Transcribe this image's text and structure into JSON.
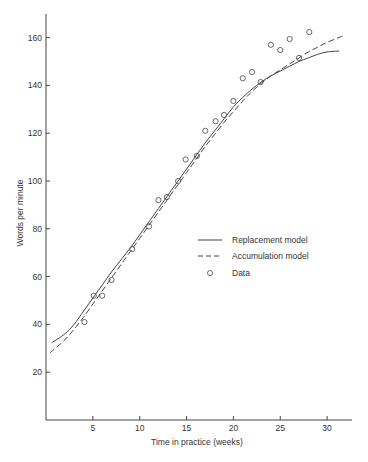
{
  "chart_data": {
    "type": "line",
    "title": "",
    "xlabel": "Time in practice (weeks)",
    "ylabel": "Words per minute",
    "xlim": [
      0,
      32.5
    ],
    "ylim": [
      0,
      170
    ],
    "xticks": [
      5,
      10,
      15,
      20,
      25,
      30
    ],
    "yticks": [
      20,
      40,
      60,
      80,
      100,
      120,
      140,
      160
    ],
    "grid": false,
    "legend_position": "center-right",
    "series": [
      {
        "name": "Replacement model",
        "style": "solid",
        "x": [
          0.6,
          2,
          3,
          4,
          5,
          6,
          7,
          8,
          9,
          10,
          11,
          12,
          13,
          14,
          15,
          16,
          17,
          18,
          19,
          20,
          21,
          22,
          23,
          24,
          25,
          26,
          27,
          28,
          29,
          30,
          31.3
        ],
        "values": [
          32.3,
          36,
          40,
          45.5,
          51,
          56.5,
          62,
          67,
          72,
          77.5,
          83,
          88.5,
          94,
          99.5,
          105,
          110.5,
          116,
          121,
          126,
          131,
          135,
          138.5,
          141.5,
          144,
          146,
          148,
          150,
          151.5,
          153,
          154,
          154.4
        ]
      },
      {
        "name": "Accumulation model",
        "style": "dashed",
        "x": [
          0.4,
          2,
          3,
          4,
          5,
          6,
          7,
          8,
          9,
          10,
          11,
          12,
          13,
          14,
          15,
          16,
          17,
          18,
          19,
          20,
          21,
          22,
          23,
          24,
          25,
          26,
          27,
          28,
          29,
          30,
          31.7
        ],
        "values": [
          28,
          33.5,
          38,
          43,
          48.5,
          54,
          59.5,
          65,
          70.5,
          76,
          81.5,
          87,
          92.5,
          98,
          103.5,
          109,
          114.5,
          119.5,
          124.5,
          129,
          133.5,
          137.5,
          141,
          144,
          146.5,
          149,
          151.5,
          154,
          156,
          158,
          160.7
        ]
      },
      {
        "name": "Data",
        "style": "markers",
        "x": [
          4.1,
          5.1,
          6.0,
          7.0,
          9.2,
          11.0,
          12.0,
          12.9,
          14.1,
          14.9,
          16.1,
          17.0,
          18.1,
          19.0,
          20.0,
          21.0,
          22.0,
          22.9,
          24.0,
          25.0,
          26.0,
          27.0,
          28.1
        ],
        "values": [
          41,
          52,
          52,
          58.6,
          71.5,
          81,
          92,
          93.3,
          100,
          109,
          110.5,
          121,
          125,
          127.6,
          133.5,
          143,
          145.6,
          141.4,
          157,
          154.8,
          159.4,
          151.5,
          162.3
        ]
      }
    ]
  },
  "legend": {
    "items": [
      {
        "label": "Replacement model"
      },
      {
        "label": "Accumulation model"
      },
      {
        "label": "Data"
      }
    ]
  }
}
